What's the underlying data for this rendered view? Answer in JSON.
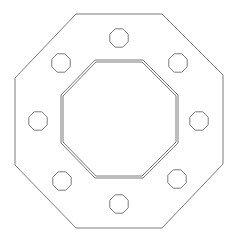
{
  "diagram": {
    "type": "octagonal flange plate drawing",
    "stroke_color": "#7a7a7a",
    "background": "#ffffff",
    "outer_octagon": {
      "points": [
        [
          76,
          14
        ],
        [
          162,
          14
        ],
        [
          223,
          75
        ],
        [
          223,
          164
        ],
        [
          162,
          228
        ],
        [
          76,
          228
        ],
        [
          15,
          165
        ],
        [
          15,
          78
        ]
      ]
    },
    "inner_octagon_outer": {
      "points": [
        [
          95,
          60
        ],
        [
          143,
          60
        ],
        [
          178,
          95
        ],
        [
          178,
          143
        ],
        [
          143,
          178
        ],
        [
          95,
          178
        ],
        [
          61,
          143
        ],
        [
          61,
          95
        ]
      ]
    },
    "inner_octagon_inner": {
      "points": [
        [
          96,
          62
        ],
        [
          142,
          62
        ],
        [
          176,
          96
        ],
        [
          176,
          142
        ],
        [
          142,
          176
        ],
        [
          96,
          176
        ],
        [
          63,
          142
        ],
        [
          63,
          96
        ]
      ]
    },
    "bolt_holes": [
      {
        "id": "top",
        "cx": 119,
        "cy": 38,
        "r": 10
      },
      {
        "id": "top-right",
        "cx": 178,
        "cy": 63,
        "r": 10
      },
      {
        "id": "right",
        "cx": 199,
        "cy": 121,
        "r": 10
      },
      {
        "id": "bottom-right",
        "cx": 177,
        "cy": 179,
        "r": 10
      },
      {
        "id": "bottom",
        "cx": 119,
        "cy": 204,
        "r": 10
      },
      {
        "id": "bottom-left",
        "cx": 62,
        "cy": 181,
        "r": 10
      },
      {
        "id": "left",
        "cx": 38,
        "cy": 121,
        "r": 10
      },
      {
        "id": "top-left",
        "cx": 61,
        "cy": 63,
        "r": 10
      }
    ]
  }
}
